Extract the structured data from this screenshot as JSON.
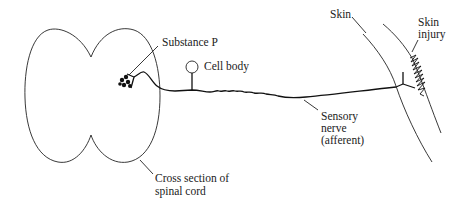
{
  "diagram": {
    "type": "anatomical-schematic",
    "labels": {
      "substance_p": "Substance P",
      "cell_body": "Cell body",
      "skin": "Skin",
      "skin_injury_line1": "Skin",
      "skin_injury_line2": "injury",
      "sensory_nerve_line1": "Sensory",
      "sensory_nerve_line2": "nerve",
      "sensory_nerve_line3": "(afferent)",
      "spinal_cord_line1": "Cross section of",
      "spinal_cord_line2": "spinal cord"
    },
    "colors": {
      "stroke": "#222222",
      "background": "#ffffff"
    }
  }
}
